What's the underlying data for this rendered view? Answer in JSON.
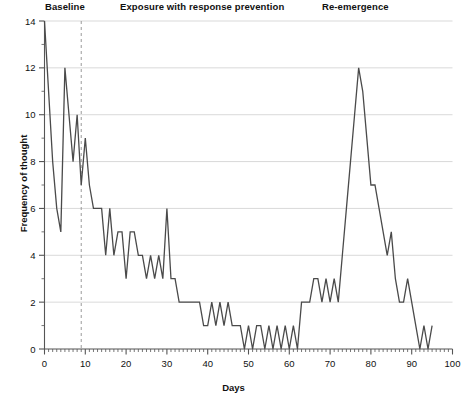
{
  "figure": {
    "title": "",
    "phases": [
      {
        "name": "baseline",
        "label": "Baseline",
        "start_day": 0,
        "end_day": 9
      },
      {
        "name": "exposure",
        "label": "Exposure with response prevention",
        "start_day": 9,
        "end_day": 67
      },
      {
        "name": "reemergence",
        "label": "Re-emergence",
        "start_day": 67,
        "end_day": 100
      }
    ],
    "phase_divider_day": 9,
    "axis_label_y": "Frequency of thought",
    "axis_label_x": "Days",
    "line_color": "#4a4a4a",
    "grid_color": "#cfcfcf",
    "divider_color": "#9a9a9a",
    "axis_color": "#555555"
  },
  "chart_data": {
    "type": "line",
    "title": "",
    "xlabel": "Days",
    "ylabel": "Frequency of thought",
    "xlim": [
      0,
      100
    ],
    "ylim": [
      0,
      14
    ],
    "xticks": [
      0,
      10,
      20,
      30,
      40,
      50,
      60,
      70,
      80,
      90,
      100
    ],
    "yticks": [
      0,
      2,
      4,
      6,
      8,
      10,
      12,
      14
    ],
    "xtick_labels": [
      "0",
      "10",
      "20",
      "30",
      "40",
      "50",
      "60",
      "70",
      "80",
      "90",
      "100"
    ],
    "ytick_labels": [
      "0",
      "2",
      "4",
      "6",
      "8",
      "10",
      "12",
      "14"
    ],
    "minor_xtick_step": 1,
    "grid": "horizontal",
    "legend": "none",
    "annotations": [
      {
        "text": "Baseline",
        "day_center": 5
      },
      {
        "text": "Exposure with response prevention",
        "day_center": 36
      },
      {
        "text": "Re-emergence",
        "day_center": 81
      },
      {
        "text": "phase change (dashed vertical line)",
        "day": 9
      }
    ],
    "series": [
      {
        "name": "Frequency of thought",
        "color": "#4a4a4a",
        "x": [
          0,
          1,
          2,
          3,
          4,
          5,
          6,
          7,
          8,
          9,
          10,
          11,
          12,
          13,
          14,
          15,
          16,
          17,
          18,
          19,
          20,
          21,
          22,
          23,
          24,
          25,
          26,
          27,
          28,
          29,
          30,
          31,
          32,
          33,
          34,
          35,
          36,
          37,
          38,
          39,
          40,
          41,
          42,
          43,
          44,
          45,
          46,
          47,
          48,
          49,
          50,
          51,
          52,
          53,
          54,
          55,
          56,
          57,
          58,
          59,
          60,
          61,
          62,
          63,
          64,
          65,
          66,
          67,
          68,
          69,
          70,
          71,
          72,
          73,
          74,
          75,
          76,
          77,
          78,
          79,
          80,
          81,
          82,
          83,
          84,
          85,
          86,
          87,
          88,
          89,
          90,
          91,
          92,
          93,
          94,
          95
        ],
        "values": [
          14,
          11,
          8,
          6,
          5,
          12,
          10,
          8,
          10,
          7,
          9,
          7,
          6,
          6,
          6,
          4,
          6,
          4,
          5,
          5,
          3,
          5,
          5,
          4,
          4,
          3,
          4,
          3,
          4,
          3,
          6,
          3,
          3,
          2,
          2,
          2,
          2,
          2,
          2,
          1,
          1,
          2,
          1,
          2,
          1,
          2,
          1,
          1,
          1,
          0,
          1,
          0,
          1,
          1,
          0,
          1,
          0,
          1,
          0,
          1,
          0,
          1,
          0,
          2,
          2,
          2,
          3,
          3,
          2,
          3,
          2,
          3,
          2,
          4,
          6,
          8,
          10,
          12,
          11,
          9,
          7,
          7,
          6,
          5,
          4,
          5,
          3,
          2,
          2,
          3,
          2,
          1,
          0,
          1,
          0,
          1
        ]
      }
    ]
  }
}
